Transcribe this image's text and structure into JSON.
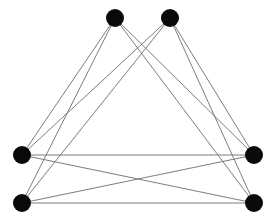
{
  "figure": {
    "width": 278,
    "height": 224,
    "background_color": "#ffffff"
  },
  "style": {
    "vertex_color": "#0a0a0a",
    "vertex_radius": 9,
    "edge_color": "#6e6e6e",
    "edge_width": 0.9
  },
  "chart_data": {
    "type": "diagram",
    "diagram_kind": "undirected-graph",
    "title": "",
    "vertex_count": 6,
    "edge_count": 12,
    "vertices": [
      {
        "id": "t1",
        "label": "",
        "x": 115,
        "y": 18,
        "r": 9,
        "color": "#0a0a0a"
      },
      {
        "id": "t2",
        "label": "",
        "x": 170,
        "y": 18,
        "r": 9,
        "color": "#0a0a0a"
      },
      {
        "id": "l1",
        "label": "",
        "x": 22,
        "y": 155,
        "r": 9,
        "color": "#0a0a0a"
      },
      {
        "id": "l2",
        "label": "",
        "x": 22,
        "y": 203,
        "r": 9,
        "color": "#0a0a0a"
      },
      {
        "id": "r1",
        "label": "",
        "x": 254,
        "y": 155,
        "r": 9,
        "color": "#0a0a0a"
      },
      {
        "id": "r2",
        "label": "",
        "x": 254,
        "y": 203,
        "r": 9,
        "color": "#0a0a0a"
      }
    ],
    "edges": [
      {
        "source": "t1",
        "target": "l1"
      },
      {
        "source": "t1",
        "target": "l2"
      },
      {
        "source": "t1",
        "target": "r1"
      },
      {
        "source": "t1",
        "target": "r2"
      },
      {
        "source": "t2",
        "target": "l1"
      },
      {
        "source": "t2",
        "target": "l2"
      },
      {
        "source": "t2",
        "target": "r1"
      },
      {
        "source": "t2",
        "target": "r2"
      },
      {
        "source": "l1",
        "target": "r1"
      },
      {
        "source": "l1",
        "target": "r2"
      },
      {
        "source": "l2",
        "target": "r1"
      },
      {
        "source": "l2",
        "target": "r2"
      }
    ],
    "legend": [],
    "annotations": []
  }
}
